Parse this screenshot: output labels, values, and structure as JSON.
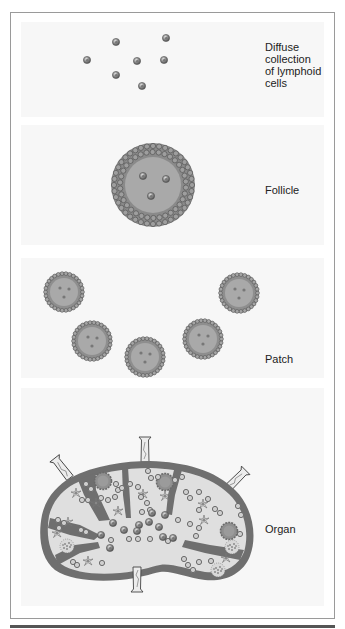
{
  "figure": {
    "stages": [
      {
        "id": "diffuse",
        "label_lines": [
          "Diffuse",
          "collection",
          "of lymphoid",
          "cells"
        ]
      },
      {
        "id": "follicle",
        "label_lines": [
          "Follicle"
        ]
      },
      {
        "id": "patch",
        "label_lines": [
          "Patch"
        ]
      },
      {
        "id": "organ",
        "label_lines": [
          "Organ"
        ]
      }
    ],
    "colors": {
      "cell_fill": "#8c8c8c",
      "tissue_gray": "#a8a8a8",
      "capsule_dark": "#6f6f6f",
      "organ_interior": "#e0e0e0",
      "vessel_fill": "#e8e8e8",
      "frame_border": "#9a9a9a"
    }
  }
}
